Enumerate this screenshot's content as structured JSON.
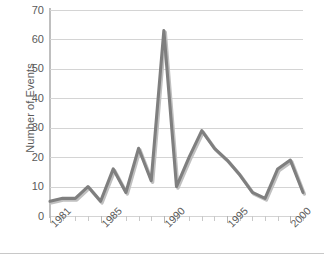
{
  "chart_data": {
    "type": "line",
    "title": "",
    "xlabel": "",
    "ylabel": "Number of Events",
    "ylim": [
      0,
      70
    ],
    "ytick_step": 10,
    "yticks": [
      0,
      10,
      20,
      30,
      40,
      50,
      60,
      70
    ],
    "xlim": [
      1981,
      2001
    ],
    "xticks_labeled": [
      1981,
      1985,
      1990,
      1995,
      2000
    ],
    "xtick_labels": [
      "1981",
      "1985",
      "1990",
      "1995",
      "2000"
    ],
    "x": [
      1981,
      1982,
      1983,
      1984,
      1985,
      1986,
      1987,
      1988,
      1989,
      1990,
      1991,
      1992,
      1993,
      1994,
      1995,
      1996,
      1997,
      1998,
      1999,
      2000,
      2001
    ],
    "values": [
      5,
      6,
      6,
      10,
      5,
      16,
      8,
      23,
      12,
      63,
      10,
      20,
      29,
      23,
      19,
      14,
      8,
      6,
      16,
      19,
      8
    ],
    "series": [
      {
        "name": "Number of Events",
        "values": [
          5,
          6,
          6,
          10,
          5,
          16,
          8,
          23,
          12,
          63,
          10,
          20,
          29,
          23,
          19,
          14,
          8,
          6,
          16,
          19,
          8
        ],
        "color": "#808080"
      }
    ],
    "grid": "horizontal",
    "legend": "none",
    "x_tick_labels_rotated": true,
    "line_color": "#7f7f7f",
    "shadow_color": "#c0c0c0",
    "gridline_color": "#d4d4d4",
    "axis_color": "#bfbfbf",
    "background_color": "#ffffff",
    "text_color": "#5a5a5a"
  }
}
